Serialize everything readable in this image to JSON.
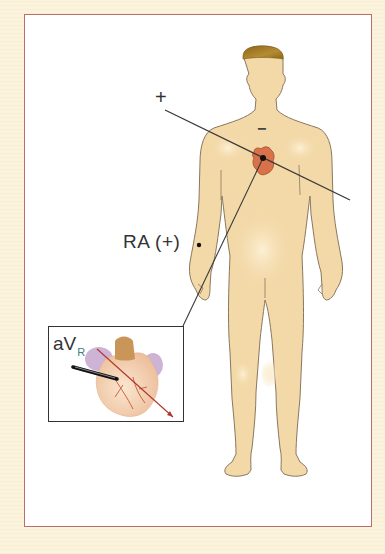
{
  "diagram": {
    "title": "",
    "labels": {
      "positive_pole": "+",
      "negative_pole": "−",
      "electrode": "RA (+)",
      "lead_name": "aV",
      "lead_subscript": "R"
    },
    "colors": {
      "background": "#fbf3dc",
      "frame_border": "#b7716a",
      "skin": "#f3d9a8",
      "skin_outline": "#8a7760",
      "hair": "#9c7424",
      "heart": "#d9714a",
      "axis_line": "#3a3a3a",
      "vector_arrow": "#b4352b"
    },
    "elements": [
      {
        "id": "human-figure",
        "description": "Anterior view of standing human body"
      },
      {
        "id": "heart",
        "description": "Heart on chest, with central dot at lead origin"
      },
      {
        "id": "lead-axis",
        "description": "Line from + (upper left) through heart to lower right"
      },
      {
        "id": "ra-electrode",
        "description": "Dot on right arm labelled RA (+)"
      },
      {
        "id": "inset",
        "description": "Inset box showing anatomical heart with aVR vector arrow"
      }
    ]
  }
}
